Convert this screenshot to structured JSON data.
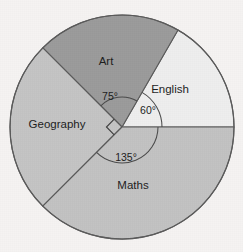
{
  "figure": {
    "background_color": "#f5f3f2",
    "outline_color": "#5a5a5a",
    "text_color": "#1d1d1d"
  },
  "chart_data": {
    "type": "pie",
    "title": "",
    "xlabel": "",
    "ylabel": "",
    "legend_position": "none",
    "grid": false,
    "units": "degrees",
    "total_degrees": 360,
    "start_angle_deg": 0,
    "direction": "counterclockwise",
    "center": {
      "x": 122,
      "y": 127
    },
    "radius": 112,
    "categories": [
      "English",
      "Art",
      "Geography",
      "Maths"
    ],
    "values": [
      60,
      75,
      90,
      135
    ],
    "slices": [
      {
        "label": "English",
        "value": 60,
        "angle_label": "60°",
        "start_deg": 0,
        "end_deg": 60,
        "color": "#eeeeee",
        "label_x": 170,
        "label_y": 90
      },
      {
        "label": "Art",
        "value": 75,
        "angle_label": "75°",
        "start_deg": 60,
        "end_deg": 135,
        "color": "#9b9b9b",
        "label_x": 106,
        "label_y": 62
      },
      {
        "label": "Geography",
        "value": 90,
        "angle_label": "",
        "start_deg": 135,
        "end_deg": 225,
        "color": "#c4c4c4",
        "label_x": 57,
        "label_y": 125
      },
      {
        "label": "Maths",
        "value": 135,
        "angle_label": "135°",
        "start_deg": 225,
        "end_deg": 360,
        "color": "#c2c2c2",
        "label_x": 133,
        "label_y": 186
      }
    ],
    "annotations": [
      {
        "name": "angle-75",
        "text": "75°",
        "x": 110,
        "y": 97
      },
      {
        "name": "angle-60",
        "text": "60°",
        "x": 148,
        "y": 111
      },
      {
        "name": "angle-135",
        "text": "135°",
        "x": 126,
        "y": 158
      },
      {
        "name": "right-angle-marker",
        "text": "",
        "x": 110,
        "y": 129
      }
    ]
  }
}
